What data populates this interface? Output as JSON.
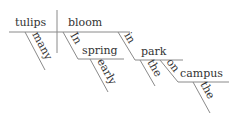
{
  "diagram": {
    "type": "sentence-diagram",
    "subject": "tulips",
    "predicate": "bloom",
    "modifiers": {
      "subject_modifier": "many",
      "phrase1": {
        "preposition": "In",
        "object": "spring",
        "object_modifier": "early"
      },
      "phrase2": {
        "preposition": "in",
        "object": "park",
        "object_modifier": "the"
      },
      "phrase3": {
        "preposition": "on",
        "object": "campus",
        "object_modifier": "the"
      }
    }
  },
  "colors": {
    "line": "#8a8a8a",
    "text": "#333333",
    "background": "#ffffff"
  }
}
